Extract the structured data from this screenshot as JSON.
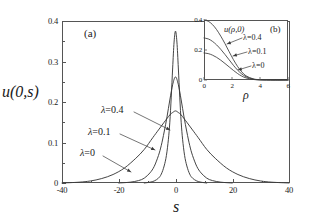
{
  "chart_data": [
    {
      "id": "main",
      "type": "line",
      "panel_label": "(a)",
      "title": "",
      "xlabel": "s",
      "ylabel": "u(0,s)",
      "xlim": [
        -40,
        40
      ],
      "ylim": [
        0,
        0.4
      ],
      "xticks": [
        -40,
        -20,
        0,
        20,
        40
      ],
      "xtick_labels": [
        "-40",
        "-20",
        "0",
        "20",
        "40"
      ],
      "yticks": [
        0,
        0.1,
        0.2,
        0.3,
        0.4
      ],
      "ytick_labels": [
        "0",
        "0.1",
        "0.2",
        "0.3",
        "0.4"
      ],
      "grid": false,
      "legend_position": "inline-annotations",
      "series": [
        {
          "name": "lambda=0",
          "label": "=0",
          "peak_value": 0.178,
          "peak_x": 0,
          "half_width": 9.5,
          "x": [
            -40,
            -34,
            -30,
            -26,
            -22,
            -18,
            -14,
            -11,
            -8,
            -6,
            -4,
            -2,
            -1,
            0,
            1,
            2,
            4,
            6,
            8,
            11,
            14,
            18,
            22,
            26,
            30,
            34,
            40
          ],
          "y": [
            0.0,
            0.002,
            0.005,
            0.011,
            0.021,
            0.037,
            0.061,
            0.083,
            0.112,
            0.131,
            0.15,
            0.168,
            0.174,
            0.178,
            0.174,
            0.168,
            0.15,
            0.131,
            0.112,
            0.083,
            0.061,
            0.037,
            0.021,
            0.011,
            0.005,
            0.002,
            0.0
          ]
        },
        {
          "name": "lambda=0.1",
          "label": "=0.1",
          "peak_value": 0.262,
          "peak_x": 0,
          "half_width": 4.6,
          "x": [
            -20,
            -16,
            -13,
            -11,
            -9,
            -7.5,
            -6,
            -5,
            -4,
            -3,
            -2,
            -1,
            0,
            1,
            2,
            3,
            4,
            5,
            6,
            7.5,
            9,
            11,
            13,
            16,
            20
          ],
          "y": [
            0.0,
            0.002,
            0.006,
            0.012,
            0.025,
            0.041,
            0.068,
            0.093,
            0.126,
            0.163,
            0.205,
            0.243,
            0.262,
            0.243,
            0.205,
            0.163,
            0.126,
            0.093,
            0.068,
            0.041,
            0.025,
            0.012,
            0.006,
            0.002,
            0.0
          ]
        },
        {
          "name": "lambda=0.4",
          "label": "=0.4",
          "peak_value": 0.375,
          "peak_x": 0,
          "half_width": 2.0,
          "x": [
            -11,
            -9,
            -7.5,
            -6,
            -5,
            -4,
            -3.2,
            -2.5,
            -2,
            -1.5,
            -1,
            -0.5,
            0,
            0.5,
            1,
            1.5,
            2,
            2.5,
            3.2,
            4,
            5,
            6,
            7.5,
            9,
            11
          ],
          "y": [
            0.0,
            0.002,
            0.005,
            0.012,
            0.022,
            0.042,
            0.068,
            0.108,
            0.15,
            0.212,
            0.284,
            0.348,
            0.375,
            0.348,
            0.284,
            0.212,
            0.15,
            0.108,
            0.068,
            0.042,
            0.022,
            0.012,
            0.005,
            0.002,
            0.0
          ]
        }
      ],
      "annotations": [
        {
          "text_lambda": "λ",
          "text": "=0.4",
          "label_x": 101,
          "label_y": 110
        },
        {
          "text_lambda": "λ",
          "text": "=0.1",
          "label_x": 88,
          "label_y": 132
        },
        {
          "text_lambda": "λ",
          "text": "=0",
          "label_x": 80,
          "label_y": 153
        }
      ]
    },
    {
      "id": "inset",
      "type": "line",
      "panel_label": "(b)",
      "title": "u(ρ,0)",
      "xlabel": "ρ",
      "ylabel": "",
      "xlim": [
        0,
        6
      ],
      "ylim": [
        0,
        0.4
      ],
      "xticks": [
        0,
        2,
        4,
        6
      ],
      "xtick_labels": [
        "0",
        "2",
        "4",
        "6"
      ],
      "yticks": [
        0,
        0.2,
        0.4
      ],
      "ytick_labels": [
        "0",
        "0.2",
        "0.4"
      ],
      "grid": false,
      "legend_position": "inline-annotations",
      "series": [
        {
          "name": "lambda=0.4",
          "label": "=0.4",
          "value_at_zero": 0.4,
          "x": [
            0,
            0.3,
            0.6,
            0.9,
            1.2,
            1.5,
            1.8,
            2.1,
            2.4,
            2.7,
            3.0,
            3.5,
            4.0,
            5.0,
            6.0
          ],
          "y": [
            0.4,
            0.392,
            0.37,
            0.336,
            0.292,
            0.242,
            0.188,
            0.136,
            0.09,
            0.054,
            0.028,
            0.008,
            0.002,
            0.0,
            0.0
          ]
        },
        {
          "name": "lambda=0.1",
          "label": "=0.1",
          "value_at_zero": 0.28,
          "x": [
            0,
            0.3,
            0.6,
            0.9,
            1.2,
            1.5,
            1.8,
            2.1,
            2.4,
            2.7,
            3.0,
            3.5,
            4.0,
            5.0,
            6.0
          ],
          "y": [
            0.28,
            0.274,
            0.258,
            0.234,
            0.204,
            0.17,
            0.134,
            0.098,
            0.066,
            0.04,
            0.022,
            0.006,
            0.001,
            0.0,
            0.0
          ]
        },
        {
          "name": "lambda=0",
          "label": "=0",
          "value_at_zero": 0.18,
          "x": [
            0,
            0.3,
            0.6,
            0.9,
            1.2,
            1.5,
            1.8,
            2.1,
            2.4,
            2.7,
            3.0,
            3.5,
            4.0,
            5.0,
            6.0
          ],
          "y": [
            0.18,
            0.176,
            0.166,
            0.151,
            0.132,
            0.11,
            0.087,
            0.064,
            0.043,
            0.026,
            0.014,
            0.004,
            0.001,
            0.0,
            0.0
          ]
        }
      ],
      "annotations": [
        {
          "text_lambda": "λ",
          "text": "=0.4",
          "label_x": 243,
          "label_y": 38
        },
        {
          "text_lambda": "λ",
          "text": "=0.1",
          "label_x": 248,
          "label_y": 52
        },
        {
          "text_lambda": "λ",
          "text": "=0",
          "label_x": 252,
          "label_y": 66
        }
      ]
    }
  ],
  "colors": {
    "axis": "#555555",
    "curve": "#3a3a3a",
    "text": "#1a1a1a",
    "background": "#ffffff"
  }
}
